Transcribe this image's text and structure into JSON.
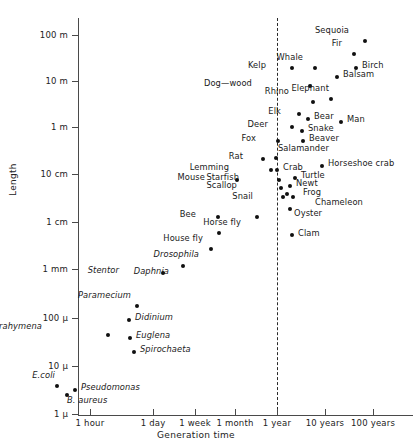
{
  "chart_data": {
    "type": "scatter",
    "title": "",
    "xlabel": "Generation time",
    "ylabel": "Length",
    "grid": false,
    "legend_position": "none",
    "xscale": "log",
    "yscale": "log",
    "xtick_labels": [
      "1 hour",
      "1 day",
      "1 week",
      "1 month",
      "1 year",
      "10 years",
      "100 years"
    ],
    "xtick_px": [
      90,
      153,
      195,
      235,
      277,
      325,
      373
    ],
    "ytick_labels": [
      "100 m",
      "10 m",
      "1 m",
      "10 cm",
      "1 cm",
      "1 mm",
      "100 µ",
      "10 µ",
      "1 µ"
    ],
    "ytick_px": [
      35,
      81,
      127,
      174,
      222,
      269,
      318,
      366,
      414
    ],
    "annotations": [
      {
        "name": "year-reference-line",
        "label": "1 year dashed vertical reference line",
        "x_px": 277
      }
    ],
    "points": [
      {
        "name": "Sequoia",
        "px": 365,
        "py": 41,
        "length": "100 m",
        "generation_time": "100 years",
        "label_dx": -16,
        "label_dy": -12,
        "italic": false
      },
      {
        "name": "Fir",
        "px": 354,
        "py": 54,
        "length": "60 m",
        "generation_time": "70 years",
        "label_dx": -12,
        "label_dy": -12,
        "italic": false
      },
      {
        "name": "Birch",
        "px": 356,
        "py": 68,
        "length": "25 m",
        "generation_time": "70 years",
        "label_dx": 6,
        "label_dy": -4,
        "italic": false
      },
      {
        "name": "Whale",
        "px": 315,
        "py": 68,
        "length": "25 m",
        "generation_time": "12 years",
        "label_dx": -12,
        "label_dy": -12,
        "italic": false
      },
      {
        "name": "Kelp",
        "px": 292,
        "py": 68,
        "length": "25 m",
        "generation_time": "3 years",
        "label_dx": -26,
        "label_dy": -4,
        "italic": false
      },
      {
        "name": "Balsam",
        "px": 337,
        "py": 77,
        "length": "16 m",
        "generation_time": "30 years",
        "label_dx": 6,
        "label_dy": -4,
        "italic": false
      },
      {
        "name": "Dog—wood",
        "px": 310,
        "py": 86,
        "length": "9 m",
        "generation_time": "10 years",
        "label_dx": -58,
        "label_dy": -4,
        "italic": false
      },
      {
        "name": "Elephant",
        "px": 331,
        "py": 99,
        "length": "4 m",
        "generation_time": "20 years",
        "label_dx": -2,
        "label_dy": -12,
        "italic": false
      },
      {
        "name": "Rhino",
        "px": 313,
        "py": 102,
        "length": "3.5 m",
        "generation_time": "12 years",
        "label_dx": -24,
        "label_dy": -12,
        "italic": false
      },
      {
        "name": "Elk",
        "px": 299,
        "py": 114,
        "length": "2 m",
        "generation_time": "6 years",
        "label_dx": -18,
        "label_dy": -4,
        "italic": false
      },
      {
        "name": "Bear",
        "px": 308,
        "py": 119,
        "length": "1.6 m",
        "generation_time": "9 years",
        "label_dx": 6,
        "label_dy": -4,
        "italic": false
      },
      {
        "name": "Man",
        "px": 341,
        "py": 122,
        "length": "1.5 m",
        "generation_time": "25 years",
        "label_dx": 6,
        "label_dy": -4,
        "italic": false
      },
      {
        "name": "Deer",
        "px": 292,
        "py": 127,
        "length": "1.2 m",
        "generation_time": "5 years",
        "label_dx": -24,
        "label_dy": -4,
        "italic": false
      },
      {
        "name": "Snake",
        "px": 302,
        "py": 131,
        "length": "1 m",
        "generation_time": "7 years",
        "label_dx": 6,
        "label_dy": -4,
        "italic": false
      },
      {
        "name": "Beaver",
        "px": 303,
        "py": 141,
        "length": "70 cm",
        "generation_time": "7 years",
        "label_dx": 6,
        "label_dy": -4,
        "italic": false
      },
      {
        "name": "Fox",
        "px": 278,
        "py": 141,
        "length": "70 cm",
        "generation_time": "1 year",
        "label_dx": -22,
        "label_dy": -4,
        "italic": false
      },
      {
        "name": "Rat",
        "px": 263,
        "py": 159,
        "length": "25 cm",
        "generation_time": "5 months",
        "label_dx": -20,
        "label_dy": -4,
        "italic": false
      },
      {
        "name": "Salamander",
        "px": 276,
        "py": 158,
        "length": "25 cm",
        "generation_time": "1 year",
        "label_dx": 2,
        "label_dy": -11,
        "italic": false
      },
      {
        "name": "Horseshoe crab",
        "px": 322,
        "py": 166,
        "length": "18 cm",
        "generation_time": "10 years",
        "label_dx": 6,
        "label_dy": -4,
        "italic": false
      },
      {
        "name": "Crab",
        "px": 277,
        "py": 170,
        "length": "14 cm",
        "generation_time": "1 year",
        "label_dx": 6,
        "label_dy": -4,
        "italic": false
      },
      {
        "name": "Lemming",
        "px": 271,
        "py": 170,
        "length": "14 cm",
        "generation_time": "9 months",
        "label_dx": -42,
        "label_dy": -4,
        "italic": false
      },
      {
        "name": "Turtle",
        "px": 295,
        "py": 178,
        "length": "11 cm",
        "generation_time": "3 years",
        "label_dx": 6,
        "label_dy": -4,
        "italic": false
      },
      {
        "name": "Starfish",
        "px": 279,
        "py": 180,
        "length": "10 cm",
        "generation_time": "1 year",
        "label_dx": -40,
        "label_dy": -4,
        "italic": false
      },
      {
        "name": "Mouse",
        "px": 237,
        "py": 180,
        "length": "10 cm",
        "generation_time": "1 month",
        "label_dx": -32,
        "label_dy": -4,
        "italic": false
      },
      {
        "name": "Newt",
        "px": 290,
        "py": 186,
        "length": "8 cm",
        "generation_time": "2 years",
        "label_dx": 6,
        "label_dy": -4,
        "italic": false
      },
      {
        "name": "Scallop",
        "px": 281,
        "py": 188,
        "length": "7.5 cm",
        "generation_time": "1 year",
        "label_dx": -44,
        "label_dy": -4,
        "italic": false
      },
      {
        "name": "Frog",
        "px": 287,
        "py": 194,
        "length": "6 cm",
        "generation_time": "2 years",
        "label_dx": 16,
        "label_dy": -3,
        "italic": false
      },
      {
        "name": "Chameleon",
        "px": 293,
        "py": 197,
        "length": "5.5 cm",
        "generation_time": "2 years",
        "label_dx": 22,
        "label_dy": 4,
        "italic": false
      },
      {
        "name": "Snail",
        "px": 283,
        "py": 197,
        "length": "5.5 cm",
        "generation_time": "1 year",
        "label_dx": -30,
        "label_dy": -2,
        "italic": false
      },
      {
        "name": "Oyster",
        "px": 290,
        "py": 209,
        "length": "3 cm",
        "generation_time": "1.5 years",
        "label_dx": 4,
        "label_dy": 3,
        "italic": false
      },
      {
        "name": "Bee",
        "px": 218,
        "py": 217,
        "length": "1.8 cm",
        "generation_time": "2 weeks",
        "label_dx": -22,
        "label_dy": -4,
        "italic": false
      },
      {
        "name": "Horse fly",
        "px": 257,
        "py": 217,
        "length": "1.8 cm",
        "generation_time": "4 months",
        "label_dx": -16,
        "label_dy": 4,
        "italic": false
      },
      {
        "name": "House fly",
        "px": 219,
        "py": 233,
        "length": "8 mm",
        "generation_time": "2 weeks",
        "label_dx": -16,
        "label_dy": 4,
        "italic": false
      },
      {
        "name": "Clam",
        "px": 292,
        "py": 235,
        "length": "7 mm",
        "generation_time": "1.5 years",
        "label_dx": 6,
        "label_dy": -3,
        "italic": false
      },
      {
        "name": "Drosophila",
        "px": 211,
        "py": 249,
        "length": "3 mm",
        "generation_time": "10 days",
        "label_dx": -12,
        "label_dy": 4,
        "italic": true
      },
      {
        "name": "Daphnia",
        "px": 183,
        "py": 266,
        "length": "1.3 mm",
        "generation_time": "3 days",
        "label_dx": -14,
        "label_dy": 4,
        "italic": true
      },
      {
        "name": "Stentor",
        "px": 163,
        "py": 273,
        "length": "1 mm",
        "generation_time": "2 days",
        "label_dx": -44,
        "label_dy": -4,
        "italic": true
      },
      {
        "name": "Paramecium",
        "px": 137,
        "py": 306,
        "length": "200 µ",
        "generation_time": "10 hours",
        "label_dx": -6,
        "label_dy": -12,
        "italic": true
      },
      {
        "name": "Didinium",
        "px": 129,
        "py": 320,
        "length": "90 µ",
        "generation_time": "8 hours",
        "label_dx": 6,
        "label_dy": -4,
        "italic": true
      },
      {
        "name": "Tetrahymena",
        "px": 108,
        "py": 335,
        "length": "50 µ",
        "generation_time": "3 hours",
        "label_dx": -66,
        "label_dy": -10,
        "italic": true
      },
      {
        "name": "Euglena",
        "px": 130,
        "py": 338,
        "length": "45 µ",
        "generation_time": "8 hours",
        "label_dx": 6,
        "label_dy": -4,
        "italic": true
      },
      {
        "name": "Spirochaeta",
        "px": 134,
        "py": 352,
        "length": "22 µ",
        "generation_time": "9 hours",
        "label_dx": 6,
        "label_dy": -4,
        "italic": true
      },
      {
        "name": "E.coli",
        "px": 57,
        "py": 386,
        "length": "3 µ",
        "generation_time": "20 minutes",
        "label_dx": -2,
        "label_dy": -12,
        "italic": true
      },
      {
        "name": "Pseudomonas",
        "px": 75,
        "py": 390,
        "length": "2.5 µ",
        "generation_time": "35 minutes",
        "label_dx": 6,
        "label_dy": -4,
        "italic": true
      },
      {
        "name": "B. aureus",
        "px": 67,
        "py": 395,
        "length": "2 µ",
        "generation_time": "28 minutes",
        "label_dx": 0,
        "label_dy": 4,
        "italic": true
      }
    ]
  }
}
